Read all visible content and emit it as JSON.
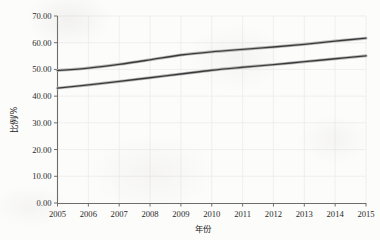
{
  "chart_data": {
    "type": "line",
    "title": "",
    "xlabel": "年份",
    "ylabel": "比例/%",
    "x": [
      2005,
      2006,
      2007,
      2008,
      2009,
      2010,
      2011,
      2012,
      2013,
      2014,
      2015
    ],
    "categories": [
      "2005",
      "2006",
      "2007",
      "2008",
      "2009",
      "2010",
      "2011",
      "2012",
      "2013",
      "2014",
      "2015"
    ],
    "xtick_labels": [
      "2005",
      "2006",
      "2007",
      "2008",
      "2009",
      "2010",
      "2011",
      "2012",
      "2013",
      "2014",
      "2015"
    ],
    "ytick_labels": [
      "0.00",
      "10.00",
      "20.00",
      "30.00",
      "40.00",
      "50.00",
      "60.00",
      "70.00"
    ],
    "ytick_values": [
      0,
      10,
      20,
      30,
      40,
      50,
      60,
      70
    ],
    "ylim": [
      0,
      70
    ],
    "xlim": [
      2005,
      2015
    ],
    "grid": true,
    "legend": "none",
    "series": [
      {
        "name": "upper-series",
        "color": "#3a3a3a",
        "values": [
          49.6,
          50.5,
          51.9,
          53.6,
          55.4,
          56.6,
          57.5,
          58.4,
          59.4,
          60.6,
          61.7
        ]
      },
      {
        "name": "lower-series",
        "color": "#3a3a3a",
        "values": [
          43.0,
          44.2,
          45.5,
          46.9,
          48.3,
          49.7,
          50.8,
          51.8,
          52.9,
          54.0,
          55.1
        ]
      }
    ]
  },
  "axes": {
    "y_axis_title": "比例/%",
    "x_axis_title": "年份"
  },
  "colors": {
    "line": "#3a3a3a",
    "axis": "#6d6d6d",
    "grid": "#ededeb",
    "text": "#2a2a2a",
    "background": "#fcfcfb"
  }
}
